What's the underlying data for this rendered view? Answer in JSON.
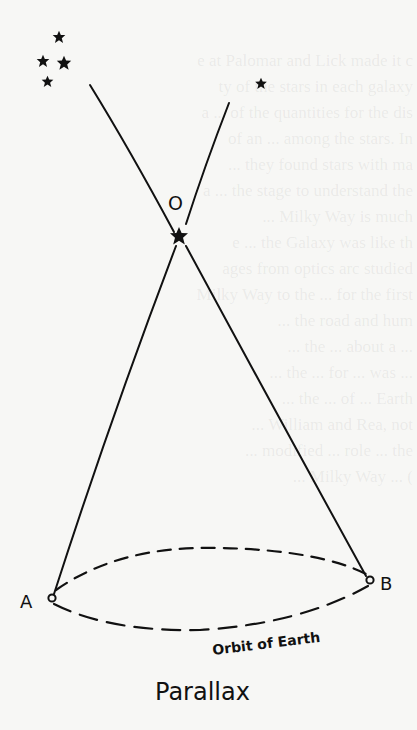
{
  "diagram": {
    "title": "Parallax",
    "labels": {
      "observer_star": "O",
      "point_a": "A",
      "point_b": "B",
      "orbit": "Orbit of Earth"
    },
    "elements": {
      "background_stars_cluster_count": 4,
      "background_star_lone_count": 1,
      "sight_lines": [
        "A-O extended to distant cluster",
        "B-O extended to lone star"
      ],
      "orbit_style": "dashed ellipse"
    },
    "colors": {
      "ink": "#111111",
      "paper": "#f7f7f5"
    }
  },
  "bleed_through": {
    "lines": [
      "e at Palomar and Lick made it c",
      "ty of the stars in each galaxy",
      "a ... of the quantities for the dis",
      "of an ... among the stars. In",
      "... they found stars with ma",
      "a ... the stage to understand the",
      "... Milky Way is much",
      "e ... the Galaxy was like th",
      "ages from optics arc studied",
      "Milky Way to the ... for the first",
      "... the road and hum",
      "... the ... about a ... ",
      "... the ... for ... was ...",
      "... the ... of ... Earth",
      "... William and Rea, not",
      "... modified ... role ... the",
      "... Milky Way ... ("
    ]
  }
}
